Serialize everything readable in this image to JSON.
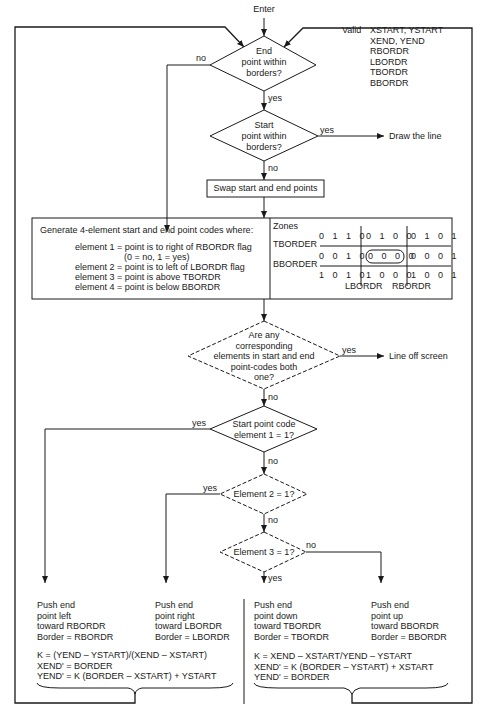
{
  "entry": "Enter",
  "inputs": {
    "label": "Valid",
    "lines": [
      "XSTART, YSTART",
      "XEND, YEND",
      "RBORDR",
      "LBORDR",
      "TBORDR",
      "BBORDR"
    ]
  },
  "decisions": {
    "end_within": {
      "text": [
        "End",
        "point within",
        "borders?"
      ],
      "no": "no",
      "yes": "yes"
    },
    "start_within": {
      "text": [
        "Start",
        "point within",
        "borders?"
      ],
      "yes": "yes",
      "no": "no"
    },
    "both_one": {
      "text": [
        "Are any",
        "corresponding",
        "elements in start and end",
        "point-codes both",
        "one?"
      ],
      "yes": "yes",
      "no": "no"
    },
    "elem1": {
      "text": [
        "Start point code",
        "element 1 = 1?"
      ],
      "yes": "yes",
      "no": "no"
    },
    "elem2": {
      "text": [
        "Element 2 = 1?"
      ],
      "yes": "yes",
      "no": "no"
    },
    "elem3": {
      "text": [
        "Element 3 = 1?"
      ],
      "yes": "yes",
      "no": "no"
    }
  },
  "outcomes": {
    "draw": "Draw the line",
    "off_screen": "Line off screen"
  },
  "swap_box": "Swap start and end points",
  "codes_box": {
    "title": "Generate 4-element start and end point codes where:",
    "lines": [
      "element 1 = point is to right of RBORDR flag",
      "(0 = no, 1 = yes)",
      "element 2 = point is to left of LBORDR flag",
      "element 3 = point is above TBORDR",
      "element 4 = point is below BBORDR"
    ]
  },
  "zones": {
    "title": "Zones",
    "rows": [
      [
        "0 1 1 0",
        "0 1 0 0",
        "0 1 0 1"
      ],
      [
        "0 0 1 0",
        "0 0 0 0",
        "0 0 0 1"
      ],
      [
        "1 0 1 0",
        "1 0 0 0",
        "1 0 0 1"
      ]
    ],
    "row_labels": [
      "TBORDER",
      "BBORDER"
    ],
    "col_labels": [
      "LBORDR",
      "RBORDR"
    ]
  },
  "actions": {
    "left": [
      "Push end",
      "point left",
      "toward RBORDR",
      "Border = RBORDR"
    ],
    "right": [
      "Push end",
      "point right",
      "toward LBORDR",
      "Border = LBORDR"
    ],
    "down": [
      "Push end",
      "point down",
      "toward TBORDR",
      "Border = TBORDR"
    ],
    "up": [
      "Push end",
      "point up",
      "toward BBORDR",
      "Border = BBORDR"
    ]
  },
  "formulas": {
    "horizontal": [
      "K = (YEND – YSTART)/(XEND – XSTART)",
      "XEND' = BORDER",
      "YEND' = K (BORDER – XSTART) + YSTART"
    ],
    "vertical": [
      "K = XEND – XSTART/YEND – YSTART",
      "XEND' = K (BORDER – YSTART) + XSTART",
      "YEND' = BORDER"
    ]
  }
}
